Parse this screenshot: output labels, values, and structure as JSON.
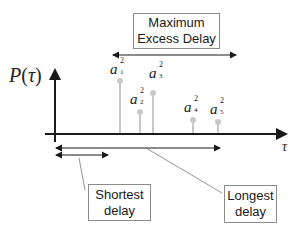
{
  "diagram": {
    "y_axis_label": "P(τ)",
    "y_axis_label_parts": {
      "func": "P",
      "open": "(",
      "var": "τ",
      "close": ")"
    },
    "x_axis_label": "τ",
    "colors": {
      "axis": "#1a1a1a",
      "stem": "#c8c8c8",
      "box_border": "#8c8c8c",
      "text": "#1a1a1a"
    },
    "taps": [
      {
        "symbol": "a",
        "sub": "1",
        "sup": "2",
        "x": 120,
        "top": 81
      },
      {
        "symbol": "a",
        "sub": "2",
        "sup": "2",
        "x": 140,
        "top": 112
      },
      {
        "symbol": "a",
        "sub": "3",
        "sup": "2",
        "x": 153,
        "top": 93
      },
      {
        "symbol": "a",
        "sub": "4",
        "sup": "2",
        "x": 193,
        "top": 120
      },
      {
        "symbol": "a",
        "sub": "5",
        "sup": "2",
        "x": 218,
        "top": 122
      }
    ],
    "callouts": {
      "max_excess": {
        "line1": "Maximum",
        "line2": "Excess Delay"
      },
      "shortest": {
        "line1": "Shortest",
        "line2": "delay"
      },
      "longest": {
        "line1": "Longest",
        "line2": "delay"
      }
    }
  }
}
